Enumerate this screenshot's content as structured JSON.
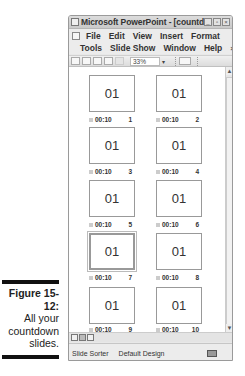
{
  "caption": {
    "figure": "Figure 15-12:",
    "lines": [
      "All your",
      "countdown",
      "slides."
    ]
  },
  "window": {
    "title": "Microsoft PowerPoint - [countdow...",
    "controls": [
      "minimize",
      "restore",
      "close"
    ],
    "menu_row1": [
      "File",
      "Edit",
      "View",
      "Insert",
      "Format"
    ],
    "menu_row2": [
      "Tools",
      "Slide Show",
      "Window",
      "Help"
    ],
    "menu_close": "×"
  },
  "toolbar": {
    "zoom": "33%",
    "zoom_arrow": "▾"
  },
  "slides": [
    {
      "text": "01",
      "timing": "00:10",
      "number": "1"
    },
    {
      "text": "01",
      "timing": "00:10",
      "number": "2"
    },
    {
      "text": "01",
      "timing": "00:10",
      "number": "3"
    },
    {
      "text": "01",
      "timing": "00:10",
      "number": "4"
    },
    {
      "text": "01",
      "timing": "00:10",
      "number": "5"
    },
    {
      "text": "01",
      "timing": "00:10",
      "number": "6"
    },
    {
      "text": "01",
      "timing": "00:10",
      "number": "7",
      "selected": true
    },
    {
      "text": "01",
      "timing": "00:10",
      "number": "8"
    },
    {
      "text": "01",
      "timing": "00:10",
      "number": "9"
    },
    {
      "text": "01",
      "timing": "00:10",
      "number": "10"
    }
  ],
  "scrollbar": {
    "up": "▲",
    "down": "▼"
  },
  "status": {
    "view": "Slide Sorter",
    "design": "Default Design"
  }
}
